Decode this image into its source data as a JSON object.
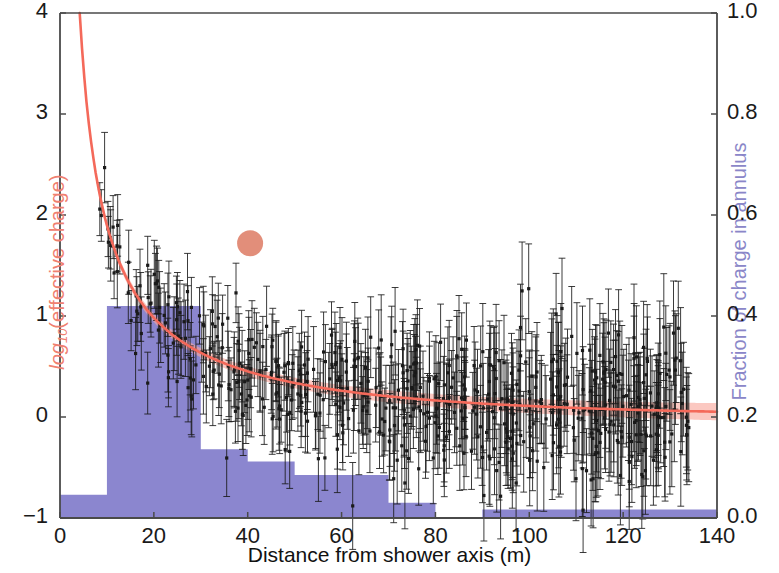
{
  "chart_data": {
    "type": "scatter",
    "title": "",
    "xlabel": "Distance from shower axis (m)",
    "ylabel_left": "log10(effective charge)",
    "ylabel_right": "Fraction of charge in annulus",
    "xlim": [
      0,
      140
    ],
    "ylim_left": [
      -1,
      4
    ],
    "ylim_right": [
      0.0,
      1.0
    ],
    "xticks": [
      0,
      20,
      40,
      60,
      80,
      100,
      120,
      140
    ],
    "xtick_labels": [
      "0",
      "20",
      "40",
      "60",
      "80",
      "100",
      "120",
      "140"
    ],
    "yticks_left": [
      -1,
      0,
      1,
      2,
      3,
      4
    ],
    "ytick_labels_left": [
      "−1",
      "0",
      "1",
      "2",
      "3",
      "4"
    ],
    "yticks_right": [
      0.0,
      0.2,
      0.4,
      0.6,
      0.8,
      1.0
    ],
    "ytick_labels_right": [
      "0.0",
      "0.2",
      "0.4",
      "0.6",
      "0.8",
      "1.0"
    ],
    "grid": false,
    "legend": "none",
    "series": [
      {
        "name": "effective charge measurements",
        "type": "scatter-errorbar",
        "color": "#1a1a1a",
        "marker": "square",
        "axis": "left",
        "n_points": 620,
        "x_range": [
          7,
          134
        ],
        "trend_a": 4.35,
        "trend_b": 0.0118,
        "trend_c": 0.78,
        "scatter_sigma": 0.26,
        "errbar_mean": 0.22,
        "errbar_jitter": 0.12,
        "seed": 20240517
      },
      {
        "name": "fitted lateral distribution",
        "type": "line-band",
        "color": "#f4695a",
        "band_color": "#f9a79b",
        "axis": "left",
        "x_start": 4.2,
        "x_end": 140,
        "fit_a": 4.35,
        "fit_b": 0.0118,
        "fit_c": 0.78,
        "band_half_width_at_0": 0.035,
        "band_half_width_at_140": 0.085
      },
      {
        "name": "reference marker",
        "type": "marker",
        "color": "#e0846f",
        "axis": "left",
        "x": 40.5,
        "y": 1.72,
        "radius_px": 13
      },
      {
        "name": "fraction of charge in annulus",
        "type": "histogram-step",
        "color": "#8b86cf",
        "axis": "right",
        "bin_edges": [
          0,
          10,
          20,
          30,
          40,
          50,
          60,
          70,
          80,
          90,
          100,
          110,
          120,
          130,
          140
        ],
        "values": [
          0.046,
          0.42,
          0.42,
          0.136,
          0.112,
          0.085,
          0.085,
          0.03,
          0.0,
          0.017,
          0.017,
          0.017,
          0.017,
          0.017
        ]
      }
    ]
  },
  "axes": {
    "x_title": "Distance from shower axis (m)",
    "y_left_title_prefix": "log",
    "y_left_title_sub": "10",
    "y_left_title_rest": "(effective charge)",
    "y_right_title": "Fraction of charge in annulus"
  },
  "colors": {
    "fit_line": "#f4695a",
    "fit_band": "#f9a79b",
    "histogram": "#8b86cf",
    "left_axis_label": "#f08070",
    "right_axis_label": "#8a86c8",
    "data_points": "#1a1a1a",
    "axis_line": "#4a4a4a",
    "background": "#ffffff"
  }
}
